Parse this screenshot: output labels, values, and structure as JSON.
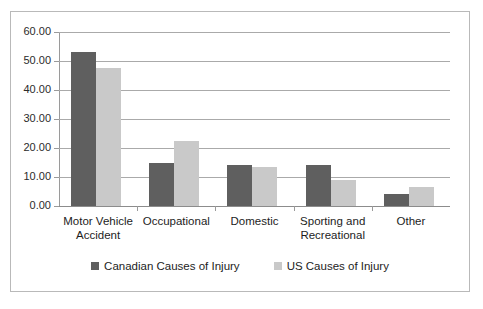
{
  "chart_data": {
    "type": "bar",
    "title": "",
    "subtitle": "",
    "xlabel": "",
    "ylabel": "",
    "ylim": [
      0,
      60
    ],
    "ytick_step": 10,
    "ytick_labels": [
      "60.00",
      "50.00",
      "40.00",
      "30.00",
      "20.00",
      "10.00",
      "0.00"
    ],
    "ytick_values": [
      60,
      50,
      40,
      30,
      20,
      10,
      0
    ],
    "grid": true,
    "legend_position": "bottom",
    "categories": [
      "Motor Vehicle Accident",
      "Occupational",
      "Domestic",
      "Sporting and Recreational",
      "Other"
    ],
    "category_lines": [
      [
        "Motor Vehicle",
        "Accident"
      ],
      [
        "Occupational"
      ],
      [
        "Domestic"
      ],
      [
        "Sporting and",
        "Recreational"
      ],
      [
        "Other"
      ]
    ],
    "series": [
      {
        "name": "Canadian Causes of Injury",
        "color": "#5f5f5f",
        "values": [
          53.0,
          15.0,
          14.0,
          14.0,
          4.0
        ]
      },
      {
        "name": "US Causes of Injury",
        "color": "#c9c9c9",
        "values": [
          47.5,
          22.5,
          13.5,
          9.0,
          6.5
        ]
      }
    ]
  },
  "legend": {
    "items": [
      {
        "label": "Canadian Causes of Injury",
        "color": "#5f5f5f"
      },
      {
        "label": "US Causes of Injury",
        "color": "#c9c9c9"
      }
    ]
  },
  "colors": {
    "series_dark": "#5f5f5f",
    "series_light": "#c9c9c9",
    "gridline": "#aaaaaa",
    "axis": "#9a9a9a",
    "frame_border": "#b9b9b9",
    "text": "#1d1d1d",
    "background": "#ffffff"
  }
}
